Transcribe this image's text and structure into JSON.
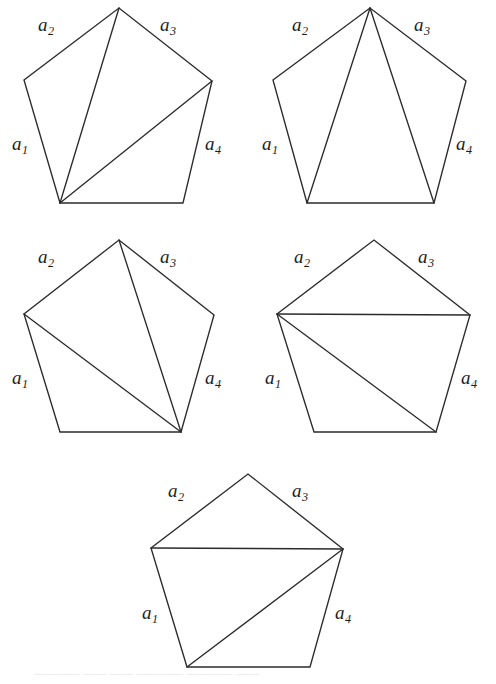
{
  "figure": {
    "background_color": "#ffffff",
    "stroke_color": "#2b2b2b",
    "label_color": "#1c1c1c",
    "width": 496,
    "height": 684,
    "side_label_texts": {
      "a1": "a",
      "a2": "a",
      "a3": "a",
      "a4": "a",
      "sub1": "1",
      "sub2": "2",
      "sub3": "3",
      "sub4": "4"
    },
    "pentagons": [
      {
        "id": "pentagon-1",
        "origin": [
          0,
          0
        ],
        "vertices": {
          "bottom_left": [
            60,
            203
          ],
          "left": [
            24,
            80
          ],
          "top": [
            119,
            8
          ],
          "right": [
            212,
            81
          ],
          "bottom_right": [
            183,
            203
          ]
        },
        "diagonals": [
          [
            "bottom_left",
            "top"
          ],
          [
            "bottom_left",
            "right"
          ]
        ],
        "labels": [
          {
            "name": "a1",
            "base": "a",
            "sub": "1",
            "x": 12,
            "y": 134
          },
          {
            "name": "a2",
            "base": "a",
            "sub": "2",
            "x": 38,
            "y": 15
          },
          {
            "name": "a3",
            "base": "a",
            "sub": "3",
            "x": 160,
            "y": 15
          },
          {
            "name": "a4",
            "base": "a",
            "sub": "4",
            "x": 205,
            "y": 134
          }
        ]
      },
      {
        "id": "pentagon-2",
        "origin": [
          248,
          0
        ],
        "vertices": {
          "bottom_left": [
            59,
            203
          ],
          "left": [
            25,
            80
          ],
          "top": [
            122,
            8
          ],
          "right": [
            218,
            81
          ],
          "bottom_right": [
            186,
            203
          ]
        },
        "diagonals": [
          [
            "top",
            "bottom_left"
          ],
          [
            "top",
            "bottom_right"
          ]
        ],
        "labels": [
          {
            "name": "a1",
            "base": "a",
            "sub": "1",
            "x": 14,
            "y": 134
          },
          {
            "name": "a2",
            "base": "a",
            "sub": "2",
            "x": 44,
            "y": 15
          },
          {
            "name": "a3",
            "base": "a",
            "sub": "3",
            "x": 166,
            "y": 15
          },
          {
            "name": "a4",
            "base": "a",
            "sub": "4",
            "x": 208,
            "y": 134
          }
        ]
      },
      {
        "id": "pentagon-3",
        "origin": [
          0,
          229
        ],
        "vertices": {
          "bottom_left": [
            60,
            203
          ],
          "left": [
            24,
            85
          ],
          "top": [
            119,
            11
          ],
          "right": [
            214,
            86
          ],
          "bottom_right": [
            181,
            203
          ]
        },
        "diagonals": [
          [
            "bottom_right",
            "top"
          ],
          [
            "bottom_right",
            "left"
          ]
        ],
        "labels": [
          {
            "name": "a1",
            "base": "a",
            "sub": "1",
            "x": 12,
            "y": 139
          },
          {
            "name": "a2",
            "base": "a",
            "sub": "2",
            "x": 38,
            "y": 18
          },
          {
            "name": "a3",
            "base": "a",
            "sub": "3",
            "x": 160,
            "y": 18
          },
          {
            "name": "a4",
            "base": "a",
            "sub": "4",
            "x": 205,
            "y": 139
          }
        ]
      },
      {
        "id": "pentagon-4",
        "origin": [
          248,
          229
        ],
        "vertices": {
          "bottom_left": [
            66,
            203
          ],
          "left": [
            29,
            85
          ],
          "top": [
            126,
            11
          ],
          "right": [
            222,
            86
          ],
          "bottom_right": [
            188,
            203
          ]
        },
        "diagonals": [
          [
            "left",
            "right"
          ],
          [
            "left",
            "bottom_right"
          ]
        ],
        "labels": [
          {
            "name": "a1",
            "base": "a",
            "sub": "1",
            "x": 17,
            "y": 139
          },
          {
            "name": "a2",
            "base": "a",
            "sub": "2",
            "x": 46,
            "y": 18
          },
          {
            "name": "a3",
            "base": "a",
            "sub": "3",
            "x": 170,
            "y": 18
          },
          {
            "name": "a4",
            "base": "a",
            "sub": "4",
            "x": 213,
            "y": 139
          }
        ]
      },
      {
        "id": "pentagon-5",
        "origin": [
          124,
          455
        ],
        "vertices": {
          "bottom_left": [
            63,
            212
          ],
          "left": [
            27,
            93
          ],
          "top": [
            124,
            19
          ],
          "right": [
            219,
            94
          ],
          "bottom_right": [
            186,
            212
          ]
        },
        "diagonals": [
          [
            "left",
            "right"
          ],
          [
            "right",
            "bottom_left"
          ]
        ],
        "labels": [
          {
            "name": "a1",
            "base": "a",
            "sub": "1",
            "x": 18,
            "y": 148
          },
          {
            "name": "a2",
            "base": "a",
            "sub": "2",
            "x": 44,
            "y": 26
          },
          {
            "name": "a3",
            "base": "a",
            "sub": "3",
            "x": 168,
            "y": 26
          },
          {
            "name": "a4",
            "base": "a",
            "sub": "4",
            "x": 211,
            "y": 148
          }
        ]
      }
    ],
    "bottom_caption": {
      "text": "———— —— —— ———— ———— ——",
      "top": 670,
      "color": "#e2e2e2"
    }
  }
}
